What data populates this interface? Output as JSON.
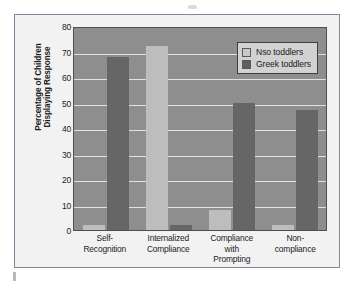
{
  "chart_data": {
    "type": "bar",
    "title": "",
    "xlabel": "",
    "ylabel_lines": [
      "Percentage of Children",
      "Displaying Response"
    ],
    "ylabel": "Percentage of Children Displaying Response",
    "ylim": [
      0,
      80
    ],
    "yticks": [
      0,
      10,
      20,
      30,
      40,
      50,
      60,
      70,
      80
    ],
    "grid": true,
    "legend_position": "top-right",
    "categories": [
      "Self-Recognition",
      "Internalized Compliance",
      "Compliance with Prompting",
      "Non-compliance"
    ],
    "category_label_lines": [
      [
        "Self-",
        "Recognition"
      ],
      [
        "Internalized",
        "Compliance"
      ],
      [
        "Compliance",
        "with",
        "Prompting"
      ],
      [
        "Non-",
        "compliance"
      ]
    ],
    "series": [
      {
        "name": "Nso toddlers",
        "color": "#bdbdbd",
        "values": [
          2,
          72,
          8,
          2
        ]
      },
      {
        "name": "Greek toddlers",
        "color": "#666666",
        "values": [
          68,
          2,
          50,
          47
        ]
      }
    ]
  },
  "figure": {
    "background_color": "#f2f2f2",
    "border_color": "#7e8a9b",
    "plot_background_color": "#8e8e8e",
    "gridline_color": "#e2e2e2"
  },
  "legend": {
    "items": [
      {
        "label": "Nso toddlers",
        "swatch": "#c9c9c9"
      },
      {
        "label": "Greek toddlers",
        "swatch": "#5e5e5e"
      }
    ]
  }
}
